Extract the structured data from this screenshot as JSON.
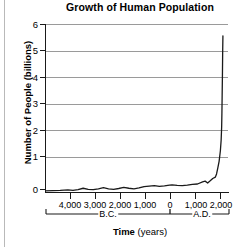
{
  "chart_data": {
    "type": "line",
    "title": "Growth of Human Population",
    "xlabel_bold": "Time",
    "xlabel_rest": " (years)",
    "ylabel": "Number of People (billions)",
    "ylim": [
      0,
      6.4
    ],
    "yticks": [
      0,
      1,
      2,
      3,
      4,
      5,
      6
    ],
    "ytick_labels": [
      "0",
      "1",
      "2",
      "3",
      "4",
      "5",
      "6"
    ],
    "xlim": [
      -5000,
      2200
    ],
    "xticks": [
      -4000,
      -3000,
      -2000,
      -1000,
      0,
      1000,
      2000
    ],
    "xtick_labels": [
      "4,000",
      "3,000",
      "2,000",
      "1,000",
      "0",
      "1,000",
      "2,000"
    ],
    "era_labels": [
      {
        "text": "B.C.",
        "x": -2000
      },
      {
        "text": "A.D.",
        "x": 1100
      }
    ],
    "grid": true,
    "legend": "none",
    "line_color": "#1a1a1a",
    "grid_color": "#9a9a9a",
    "axis_color": "#1a1a1a",
    "series": [
      {
        "name": "World population",
        "x": [
          -5000,
          -4700,
          -4400,
          -4100,
          -3900,
          -3700,
          -3500,
          -3300,
          -3100,
          -2900,
          -2700,
          -2500,
          -2300,
          -2100,
          -1900,
          -1700,
          -1500,
          -1300,
          -1100,
          -900,
          -700,
          -500,
          -300,
          -100,
          0,
          200,
          400,
          600,
          800,
          1000,
          1200,
          1300,
          1400,
          1500,
          1600,
          1700,
          1750,
          1800,
          1850,
          1900,
          1930,
          1950,
          1960,
          1970,
          1980,
          1990,
          2000
        ],
        "y": [
          0.08,
          0.09,
          0.1,
          0.12,
          0.1,
          0.13,
          0.18,
          0.14,
          0.13,
          0.16,
          0.2,
          0.16,
          0.14,
          0.17,
          0.21,
          0.18,
          0.16,
          0.19,
          0.24,
          0.26,
          0.28,
          0.25,
          0.27,
          0.3,
          0.31,
          0.29,
          0.28,
          0.3,
          0.33,
          0.34,
          0.42,
          0.45,
          0.38,
          0.46,
          0.55,
          0.6,
          0.72,
          0.95,
          1.2,
          1.6,
          2.0,
          2.5,
          3.0,
          3.7,
          4.4,
          5.3,
          5.95
        ]
      }
    ]
  }
}
